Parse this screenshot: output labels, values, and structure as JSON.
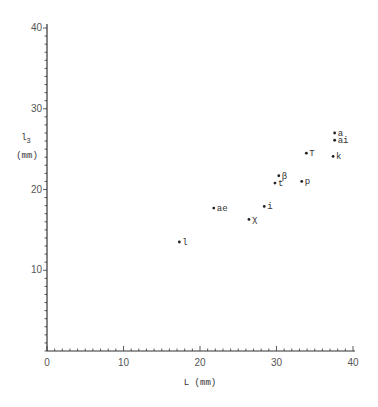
{
  "chart_data": {
    "type": "scatter",
    "title": "",
    "xlabel": "L (mm)",
    "ylabel_main": "l",
    "ylabel_sub": "3",
    "ylabel_unit": "(mm)",
    "xlim": [
      0,
      40
    ],
    "ylim": [
      0,
      40
    ],
    "x_ticks": [
      0,
      10,
      20,
      30,
      40
    ],
    "y_ticks": [
      10,
      20,
      30,
      40
    ],
    "x_minor_step": 1,
    "y_minor_step": 1,
    "grid": false,
    "legend": null,
    "points": [
      {
        "label": "a",
        "x": 37.6,
        "y": 27.0
      },
      {
        "label": "ai",
        "x": 37.6,
        "y": 26.1
      },
      {
        "label": "k",
        "x": 37.4,
        "y": 24.1
      },
      {
        "label": "T",
        "x": 33.9,
        "y": 24.5
      },
      {
        "label": "p",
        "x": 33.3,
        "y": 21.0
      },
      {
        "label": "β",
        "x": 30.3,
        "y": 21.7
      },
      {
        "label": "t",
        "x": 29.8,
        "y": 20.8
      },
      {
        "label": "i",
        "x": 28.4,
        "y": 17.9
      },
      {
        "label": "χ",
        "x": 26.4,
        "y": 16.3
      },
      {
        "label": "ae",
        "x": 21.8,
        "y": 17.7
      },
      {
        "label": "l",
        "x": 17.3,
        "y": 13.5
      }
    ],
    "colors": {
      "axis": "#333333",
      "point": "#222222",
      "text": "#333333"
    }
  }
}
